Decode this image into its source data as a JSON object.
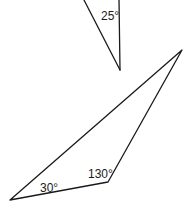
{
  "diagram": {
    "type": "geometry-triangles",
    "background": "#ffffff",
    "stroke_color": "#1a1a1a",
    "top_triangle": {
      "description": "Partially visible triangle cut off at top edge",
      "vertices": [
        [
          84,
          0
        ],
        [
          119,
          0
        ],
        [
          120,
          70
        ]
      ],
      "angle_labels": [
        {
          "text": "25°",
          "x": 101,
          "y": 20
        }
      ]
    },
    "bottom_triangle": {
      "vertices": [
        [
          10,
          200
        ],
        [
          108,
          182
        ],
        [
          182,
          50
        ]
      ],
      "angle_labels": [
        {
          "text": "30°",
          "x": 40,
          "y": 192
        },
        {
          "text": "130°",
          "x": 88,
          "y": 178
        }
      ]
    }
  }
}
